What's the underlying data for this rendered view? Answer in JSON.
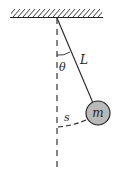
{
  "diagram": {
    "type": "simple-pendulum",
    "labels": {
      "angle": "θ",
      "length": "L",
      "arc": "s",
      "mass": "m"
    },
    "colors": {
      "line": "#222222",
      "bob_fill": "#b9b9b9",
      "background": "#ffffff"
    }
  }
}
